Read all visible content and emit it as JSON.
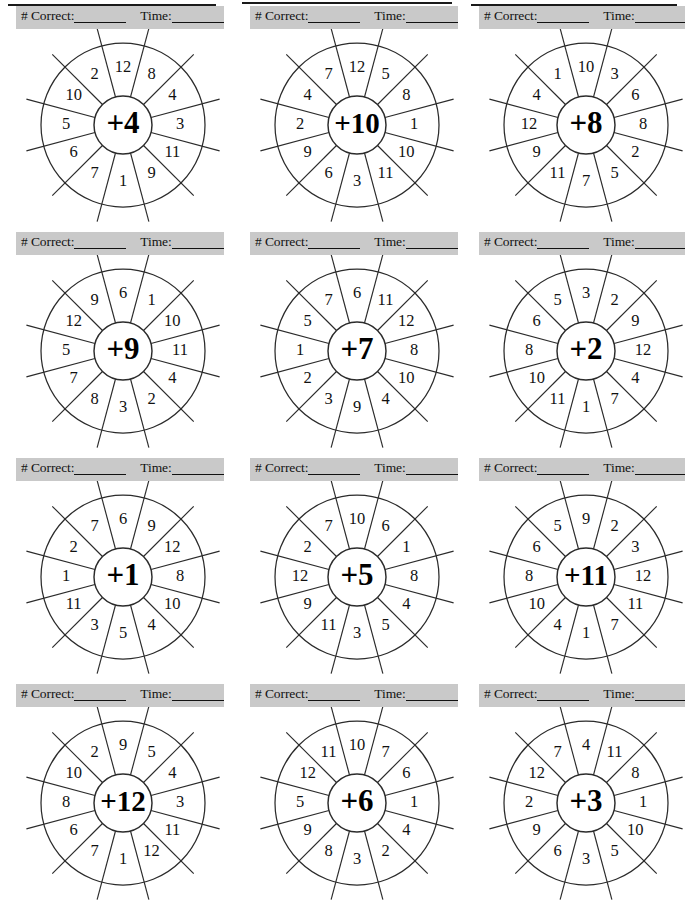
{
  "page": {
    "columns": 3,
    "rows": 4,
    "background_color": "#ffffff",
    "band_color": "#c9c9c9",
    "ink_color": "#111111"
  },
  "header": {
    "correct_label": "# Correct:",
    "time_label": "Time:",
    "correct_blank": "________",
    "time_blank": "_________"
  },
  "wheel_spec": {
    "segment_count": 12,
    "outer_radius": 82,
    "inner_radius": 29,
    "spoke_overhang": 18,
    "label_radius": 57,
    "start_angle_deg": -75
  },
  "chart_data": {
    "type": "table",
    "columns": [
      "operator",
      "operands_clockwise_from_top_left"
    ],
    "wheels": [
      {
        "id": "wheel-1",
        "operator": "+4",
        "operands": [
          8,
          4,
          3,
          11,
          9,
          1,
          7,
          6,
          5,
          10,
          2,
          12
        ]
      },
      {
        "id": "wheel-2",
        "operator": "+10",
        "operands": [
          5,
          8,
          1,
          10,
          11,
          3,
          6,
          9,
          2,
          4,
          7,
          12
        ]
      },
      {
        "id": "wheel-3",
        "operator": "+8",
        "operands": [
          3,
          6,
          8,
          2,
          5,
          7,
          11,
          9,
          12,
          4,
          1,
          10
        ]
      },
      {
        "id": "wheel-4",
        "operator": "+9",
        "operands": [
          1,
          10,
          11,
          4,
          2,
          3,
          8,
          7,
          5,
          12,
          9,
          6
        ]
      },
      {
        "id": "wheel-5",
        "operator": "+7",
        "operands": [
          11,
          12,
          8,
          10,
          4,
          9,
          3,
          2,
          1,
          5,
          7,
          6
        ]
      },
      {
        "id": "wheel-6",
        "operator": "+2",
        "operands": [
          2,
          9,
          12,
          4,
          7,
          1,
          11,
          10,
          8,
          6,
          5,
          3
        ]
      },
      {
        "id": "wheel-7",
        "operator": "+1",
        "operands": [
          9,
          12,
          8,
          10,
          4,
          5,
          3,
          11,
          1,
          2,
          7,
          6
        ]
      },
      {
        "id": "wheel-8",
        "operator": "+5",
        "operands": [
          6,
          1,
          8,
          4,
          5,
          3,
          11,
          9,
          12,
          2,
          7,
          10
        ]
      },
      {
        "id": "wheel-9",
        "operator": "+11",
        "operands": [
          2,
          3,
          12,
          11,
          7,
          1,
          4,
          10,
          8,
          6,
          5,
          9
        ]
      },
      {
        "id": "wheel-10",
        "operator": "+12",
        "operands": [
          5,
          4,
          3,
          11,
          12,
          1,
          7,
          6,
          8,
          10,
          2,
          9
        ]
      },
      {
        "id": "wheel-11",
        "operator": "+6",
        "operands": [
          7,
          6,
          1,
          4,
          2,
          3,
          8,
          9,
          5,
          12,
          11,
          10
        ]
      },
      {
        "id": "wheel-12",
        "operator": "+3",
        "operands": [
          11,
          8,
          1,
          10,
          5,
          3,
          6,
          9,
          2,
          12,
          7,
          4
        ]
      }
    ]
  }
}
